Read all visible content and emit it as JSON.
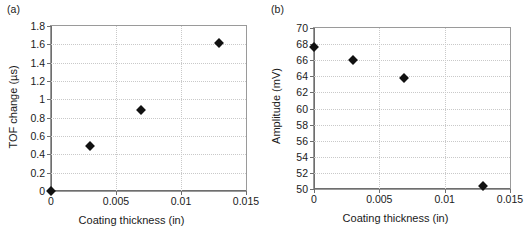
{
  "figure": {
    "panels": [
      {
        "id": "a",
        "label": "(a)",
        "xlabel": "Coating thickness (in)",
        "ylabel": "TOF change (µs)"
      },
      {
        "id": "b",
        "label": "(b)",
        "xlabel": "Coating thickness (in)",
        "ylabel": "Amplitude (mV)"
      }
    ]
  },
  "chart_data": [
    {
      "type": "scatter",
      "panel": "a",
      "title": "(a)",
      "xlabel": "Coating thickness (in)",
      "ylabel": "TOF change (µs)",
      "xlim": [
        0,
        0.015
      ],
      "ylim": [
        0,
        1.8
      ],
      "xticks": [
        0,
        0.005,
        0.01,
        0.015
      ],
      "xticklabels": [
        "0",
        "0.005",
        "0.01",
        "0.015"
      ],
      "yticks": [
        0,
        0.2,
        0.4,
        0.6,
        0.8,
        1.0,
        1.2,
        1.4,
        1.6,
        1.8
      ],
      "yticklabels": [
        "0",
        "0.2",
        "0.4",
        "0.6",
        "0.8",
        "1",
        "1.2",
        "1.4",
        "1.6",
        "1.8"
      ],
      "grid": true,
      "legend": null,
      "marker": "filled-diamond",
      "marker_color": "#111111",
      "x": [
        0,
        0.003,
        0.0069,
        0.0129
      ],
      "y": [
        0,
        0.49,
        0.885,
        1.61
      ]
    },
    {
      "type": "scatter",
      "panel": "b",
      "title": "(b)",
      "xlabel": "Coating thickness (in)",
      "ylabel": "Amplitude (mV)",
      "xlim": [
        0,
        0.015
      ],
      "ylim": [
        50,
        70
      ],
      "xticks": [
        0,
        0.005,
        0.01,
        0.015
      ],
      "xticklabels": [
        "0",
        "0.005",
        "0.01",
        "0.015"
      ],
      "yticks": [
        50,
        52,
        54,
        56,
        58,
        60,
        62,
        64,
        66,
        68,
        70
      ],
      "yticklabels": [
        "50",
        "52",
        "54",
        "56",
        "58",
        "60",
        "62",
        "64",
        "66",
        "68",
        "70"
      ],
      "grid": true,
      "legend": null,
      "marker": "filled-diamond",
      "marker_color": "#111111",
      "x": [
        0,
        0.003,
        0.0069,
        0.0129
      ],
      "y": [
        67.6,
        66.0,
        63.8,
        50.4
      ]
    }
  ]
}
